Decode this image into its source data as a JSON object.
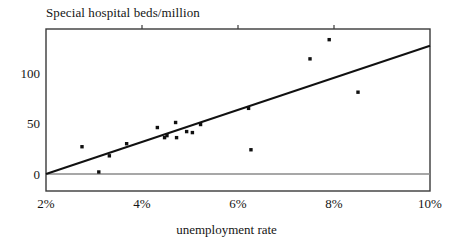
{
  "chart_data": {
    "type": "scatter",
    "title": "Special hospital beds/million",
    "xlabel": "unemployment rate",
    "ylabel": "Special hospital beds/million",
    "xlim": [
      2,
      10
    ],
    "ylim": [
      -17,
      159
    ],
    "grid": false,
    "legend": null,
    "xticks": [
      2,
      4,
      6,
      8,
      10
    ],
    "xtick_labels": [
      "2%",
      "4%",
      "6%",
      "8%",
      "10%"
    ],
    "yticks": [
      0,
      50,
      100
    ],
    "ytick_labels": [
      "0",
      "50",
      "100"
    ],
    "zero_line": 0,
    "points": [
      {
        "x": 2.75,
        "y": 27
      },
      {
        "x": 3.1,
        "y": 2
      },
      {
        "x": 3.32,
        "y": 18
      },
      {
        "x": 3.68,
        "y": 30
      },
      {
        "x": 4.32,
        "y": 46
      },
      {
        "x": 4.47,
        "y": 36
      },
      {
        "x": 4.52,
        "y": 38
      },
      {
        "x": 4.7,
        "y": 51
      },
      {
        "x": 4.72,
        "y": 36
      },
      {
        "x": 4.93,
        "y": 42
      },
      {
        "x": 5.05,
        "y": 41
      },
      {
        "x": 5.22,
        "y": 49
      },
      {
        "x": 6.22,
        "y": 65
      },
      {
        "x": 6.27,
        "y": 24
      },
      {
        "x": 7.5,
        "y": 114
      },
      {
        "x": 7.9,
        "y": 133
      },
      {
        "x": 8.5,
        "y": 81
      }
    ],
    "fit_line": {
      "x0": 2.0,
      "y0": 0,
      "x1": 10.0,
      "y1": 127
    }
  }
}
